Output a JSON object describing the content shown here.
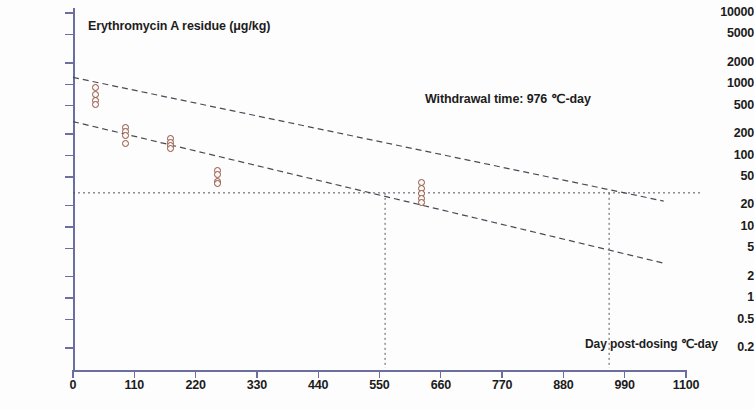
{
  "chart_data": {
    "type": "scatter",
    "title": "Erythromycin A residue (μg/kg)",
    "xlabel": "Day post-dosing  ℃-day",
    "ylabel": "Erythromycin A residue (μg/kg)",
    "yscale": "log",
    "ylim": [
      0.2,
      10000
    ],
    "xlim": [
      0,
      1100
    ],
    "grid": false,
    "legend": "none",
    "ytick_labels": [
      "10000",
      "5000",
      "2000",
      "1000",
      "500",
      "200",
      "100",
      "50",
      "20",
      "10",
      "5",
      "2",
      "1",
      "0.5",
      "0.2"
    ],
    "ytick_values": [
      10000,
      5000,
      2000,
      1000,
      500,
      200,
      100,
      50,
      20,
      10,
      5,
      2,
      1,
      0.5,
      0.2
    ],
    "xtick_labels": [
      "0",
      "110",
      "220",
      "330",
      "440",
      "550",
      "660",
      "770",
      "880",
      "990",
      "1100"
    ],
    "xtick_values": [
      0,
      110,
      220,
      330,
      440,
      550,
      660,
      770,
      880,
      990,
      1100
    ],
    "annotations": [
      {
        "name": "withdrawal-time",
        "text": "Withdrawal time: 976  ℃-day",
        "x": 976
      },
      {
        "name": "tolerance-line",
        "text": "",
        "y": 30
      }
    ],
    "reference_lines": [
      {
        "name": "tolerance-horizontal",
        "orientation": "horizontal",
        "value": 30,
        "style": "dotted"
      },
      {
        "name": "lower-intercept-vertical",
        "orientation": "vertical",
        "value": 560,
        "style": "dotted"
      },
      {
        "name": "withdrawal-vertical",
        "orientation": "vertical",
        "value": 962,
        "style": "dotted"
      }
    ],
    "series": [
      {
        "name": "upper-tolerance-limit",
        "type": "line",
        "style": "dashed",
        "points": [
          {
            "x": 0,
            "y": 1250
          },
          {
            "x": 1060,
            "y": 23
          }
        ]
      },
      {
        "name": "regression-fit",
        "type": "line",
        "style": "dashed",
        "points": [
          {
            "x": 0,
            "y": 300
          },
          {
            "x": 1060,
            "y": 3.1
          }
        ]
      },
      {
        "name": "erythromycin-a-residue-observations",
        "type": "scatter",
        "marker": "open-circle",
        "color": "#8d5140",
        "points": [
          {
            "x": 40,
            "y": 900
          },
          {
            "x": 40,
            "y": 730
          },
          {
            "x": 40,
            "y": 600
          },
          {
            "x": 40,
            "y": 520
          },
          {
            "x": 95,
            "y": 245
          },
          {
            "x": 95,
            "y": 215
          },
          {
            "x": 95,
            "y": 190
          },
          {
            "x": 95,
            "y": 150
          },
          {
            "x": 175,
            "y": 175
          },
          {
            "x": 175,
            "y": 155
          },
          {
            "x": 175,
            "y": 140
          },
          {
            "x": 175,
            "y": 125
          },
          {
            "x": 260,
            "y": 62
          },
          {
            "x": 260,
            "y": 55
          },
          {
            "x": 260,
            "y": 44
          },
          {
            "x": 260,
            "y": 40
          },
          {
            "x": 625,
            "y": 42
          },
          {
            "x": 625,
            "y": 35
          },
          {
            "x": 625,
            "y": 29
          },
          {
            "x": 625,
            "y": 25
          },
          {
            "x": 625,
            "y": 22
          }
        ]
      }
    ]
  },
  "colors": {
    "axis": "#6b6e9e",
    "marker_edge": "#8d5140",
    "text": "#1b1b1b",
    "line": "#4a4a55",
    "background": "#fdfdfd"
  }
}
